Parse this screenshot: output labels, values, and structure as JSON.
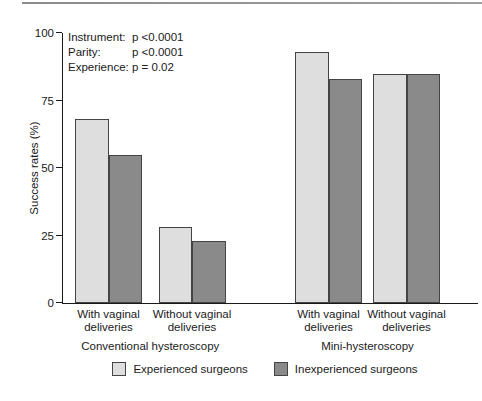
{
  "page": {
    "background": "#ffffff",
    "top_rule_color": "#9e9e9e"
  },
  "chart_data": {
    "type": "bar",
    "title": "",
    "xlabel": "",
    "ylabel": "Success rates (%)",
    "ylim": [
      0,
      100
    ],
    "yticks": [
      0,
      25,
      50,
      75,
      100
    ],
    "grid": false,
    "legend_position": "bottom-center",
    "categories": [
      {
        "line1": "With vaginal",
        "line2": "deliveries"
      },
      {
        "line1": "Without vaginal",
        "line2": "deliveries"
      },
      {
        "line1": "With vaginal",
        "line2": "deliveries"
      },
      {
        "line1": "Without vaginal",
        "line2": "deliveries"
      }
    ],
    "group_labels": [
      "Conventional hysteroscopy",
      "Mini-hysteroscopy"
    ],
    "series": [
      {
        "name": "Experienced surgeons",
        "color": "#dedede",
        "values": [
          68,
          28,
          93,
          85
        ]
      },
      {
        "name": "Inexperienced surgeons",
        "color": "#8a8a8a",
        "values": [
          55,
          23,
          83,
          85
        ]
      }
    ],
    "stats_annotations": [
      {
        "label": "Instrument:",
        "value": "p <0.0001"
      },
      {
        "label": "Parity:",
        "value": "p <0.0001"
      },
      {
        "label": "Experience:",
        "value": "p = 0.02"
      }
    ],
    "colors": {
      "axis": "#1a1a1a",
      "bar_border": "#444444",
      "text": "#1a1a1a"
    }
  }
}
